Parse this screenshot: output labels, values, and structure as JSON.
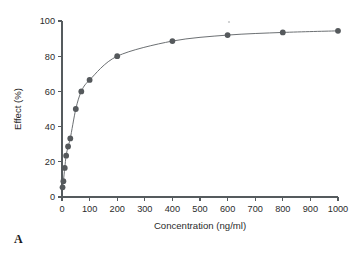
{
  "panel": {
    "label": "A"
  },
  "chart_data": {
    "type": "line",
    "title": "",
    "subtitle": "",
    "xlabel": "Concentration (ng/ml)",
    "ylabel": "Effect (%)",
    "xlim": [
      0,
      1000
    ],
    "ylim": [
      0,
      100
    ],
    "xticks": [
      0,
      100,
      200,
      300,
      400,
      500,
      600,
      700,
      800,
      900,
      1000
    ],
    "xtick_labels": [
      "0",
      "100",
      "200",
      "300",
      "400",
      "500",
      "600",
      "700",
      "800",
      "900",
      "1000"
    ],
    "yticks": [
      0,
      20,
      40,
      60,
      80,
      100
    ],
    "ytick_labels": [
      "0",
      "20",
      "40",
      "60",
      "80",
      "100"
    ],
    "grid": false,
    "legend": false,
    "legend_position": "none",
    "marker": "filled-circle",
    "marker_color": "#55595c",
    "line_color": "#6c7073",
    "series": [
      {
        "name": "Effect",
        "x": [
          2,
          5,
          10,
          15,
          22,
          30,
          50,
          70,
          100,
          200,
          400,
          600,
          800,
          1000
        ],
        "y": [
          5.5,
          9.0,
          16.5,
          23.5,
          28.7,
          33.3,
          50.0,
          60.0,
          66.5,
          80.0,
          88.6,
          92.0,
          93.5,
          94.4
        ]
      }
    ],
    "annotations": []
  },
  "colors": {
    "axis": "#555b5e",
    "text": "#2b2b2b",
    "marker": "#55595c",
    "line": "#6c7073",
    "background": "#ffffff"
  }
}
